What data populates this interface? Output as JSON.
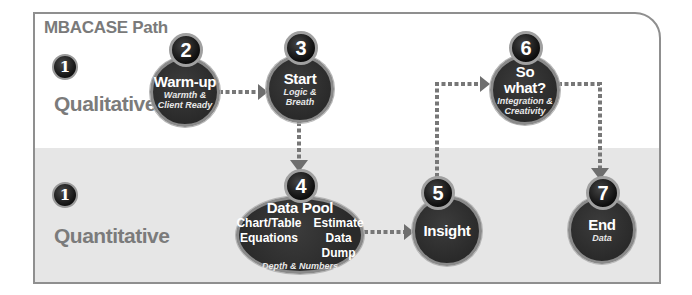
{
  "diagram": {
    "title": "MBACASE Path",
    "colors": {
      "frame_border": "#8f8f8f",
      "top_band": "#ffffff",
      "bottom_band": "#e6e6e6",
      "node_fill": "#333333",
      "node_ring": "#8a8a8a",
      "label_gray": "#7b7b7b",
      "connector": "#777777"
    },
    "rows": [
      {
        "badge": "1",
        "label": "Qualitative"
      },
      {
        "badge": "1",
        "label": "Quantitative"
      }
    ],
    "nodes": [
      {
        "number": "2",
        "name": "Warm-up",
        "sub_line1": "Warmth &",
        "sub_line2": "Client Ready"
      },
      {
        "number": "3",
        "name": "Start",
        "sub_line1": "Logic & Breath"
      },
      {
        "number": "4",
        "name": "Data Pool",
        "items": [
          "Chart/Table",
          "Estimate",
          "Equations",
          "Data Dump"
        ],
        "sub_line1": "Depth & Numbers"
      },
      {
        "number": "5",
        "name": "Insight"
      },
      {
        "number": "6",
        "name": "So what?",
        "sub_line1": "Integration &",
        "sub_line2": "Creativity"
      },
      {
        "number": "7",
        "name": "End",
        "sub_line1": "Data"
      }
    ],
    "edges": [
      {
        "from": "2",
        "to": "3"
      },
      {
        "from": "3",
        "to": "4"
      },
      {
        "from": "4",
        "to": "5"
      },
      {
        "from": "5",
        "to": "6"
      },
      {
        "from": "6",
        "to": "7"
      }
    ]
  }
}
